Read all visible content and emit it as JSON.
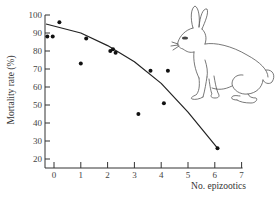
{
  "chart_data": {
    "type": "scatter",
    "title": "",
    "xlabel": "No. epizootics",
    "ylabel": "Mortality rate (%)",
    "xlim": [
      -0.3,
      7
    ],
    "ylim": [
      15,
      100
    ],
    "xticks": [
      0,
      1,
      2,
      3,
      4,
      5,
      6,
      7
    ],
    "yticks": [
      20,
      30,
      40,
      50,
      60,
      70,
      80,
      90,
      100
    ],
    "grid": false,
    "legend": null,
    "series": [
      {
        "name": "observations",
        "kind": "scatter",
        "points": [
          {
            "x": -0.25,
            "y": 88
          },
          {
            "x": -0.05,
            "y": 88
          },
          {
            "x": 0.2,
            "y": 96
          },
          {
            "x": 1.0,
            "y": 73
          },
          {
            "x": 1.2,
            "y": 87
          },
          {
            "x": 2.1,
            "y": 80
          },
          {
            "x": 2.2,
            "y": 81
          },
          {
            "x": 2.3,
            "y": 79
          },
          {
            "x": 3.15,
            "y": 45
          },
          {
            "x": 3.6,
            "y": 69
          },
          {
            "x": 4.1,
            "y": 51
          },
          {
            "x": 4.25,
            "y": 69
          },
          {
            "x": 6.1,
            "y": 26
          }
        ]
      },
      {
        "name": "fitted curve",
        "kind": "line",
        "points": [
          {
            "x": -0.3,
            "y": 95
          },
          {
            "x": 1,
            "y": 90
          },
          {
            "x": 2,
            "y": 83
          },
          {
            "x": 3,
            "y": 74
          },
          {
            "x": 4,
            "y": 62
          },
          {
            "x": 5,
            "y": 46
          },
          {
            "x": 6.1,
            "y": 26
          }
        ]
      }
    ],
    "annotations": [
      "rabbit illustration (upper right)"
    ]
  },
  "layout": {
    "plot": {
      "x0_px": 54,
      "px_per_x": 26.8,
      "y100_px": 15,
      "px_per_y": 1.8,
      "axis_x_px": 45,
      "axis_y_px": 168
    }
  }
}
